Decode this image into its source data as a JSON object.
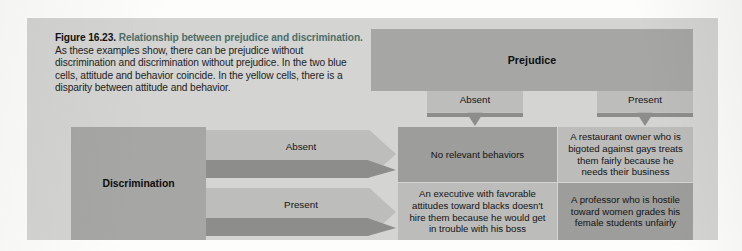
{
  "figure": {
    "number": "Figure 16.23.",
    "title": "Relationship between prejudice and discrimination.",
    "body": "As these examples show, there can be prejudice without discrimination and discrimination without prejudice. In the two blue cells, attitude and behavior coincide. In the yellow cells, there is a disparity between attitude and behavior."
  },
  "columns": {
    "header": "Prejudice",
    "levels": [
      "Absent",
      "Present"
    ]
  },
  "rows": {
    "header": "Discrimination",
    "levels": [
      "Absent",
      "Present"
    ]
  },
  "cells": {
    "absent_absent": {
      "text": "No relevant behaviors",
      "kind": "blue"
    },
    "absent_present": {
      "text": "A restaurant owner who is bigoted against gays treats them fairly because he needs their business",
      "kind": "yellow"
    },
    "present_absent": {
      "text": "An executive with favorable attitudes toward blacks doesn't hire them because he would get in trouble with his boss",
      "kind": "yellow"
    },
    "present_present": {
      "text": "A professor who is hostile toward women grades his female students unfairly",
      "kind": "blue"
    }
  },
  "colors": {
    "panel_background": "#d4d4d2",
    "header_band": "#a6a6a4",
    "arrow_tab": "#bdbdbb",
    "arrow_stroke": "#8d8d8b",
    "cell_blue": "#9d9d9b",
    "cell_yellow": "#bcbcba",
    "title_accent": "#4d6e6a"
  }
}
